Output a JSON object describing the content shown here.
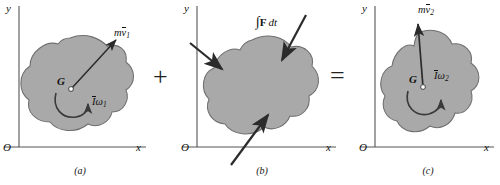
{
  "figure": {
    "background_color": "#ffffff",
    "body_fill_color": "#a9a9a9",
    "body_stroke_color": "#6f6f6f",
    "arrow_color": "#2b2b2b",
    "axis_color": "#555555"
  },
  "operators": {
    "plus": "+",
    "equals": "="
  },
  "panels": [
    {
      "id": "a",
      "caption": "(a)",
      "axes": {
        "y_label": "y",
        "x_label": "x",
        "origin_label": "O"
      },
      "center_label": "G",
      "linear_momentum": {
        "symbol_m": "m",
        "symbol_v": "v",
        "subscript": "1",
        "full": "m v̄1",
        "direction": "up-right"
      },
      "angular_momentum": {
        "symbol_I": "I",
        "symbol_omega": "ω",
        "subscript": "1",
        "full": "Īω1",
        "rotation_sense": "counterclockwise"
      }
    },
    {
      "id": "b",
      "caption": "(b)",
      "axes": {
        "y_label": "y",
        "x_label": "x",
        "origin_label": "O"
      },
      "impulse_label": {
        "integral": "∫",
        "force": "F",
        "differential": "dt",
        "full": "∫F dt"
      },
      "arrows": [
        {
          "name": "impulse-arrow-upper-left",
          "direction": "down-right"
        },
        {
          "name": "impulse-arrow-upper-right",
          "direction": "down-left"
        },
        {
          "name": "impulse-arrow-lower-left",
          "direction": "up-right"
        }
      ]
    },
    {
      "id": "c",
      "caption": "(c)",
      "axes": {
        "y_label": "y",
        "x_label": "x",
        "origin_label": "O"
      },
      "center_label": "G",
      "linear_momentum": {
        "symbol_m": "m",
        "symbol_v": "v",
        "subscript": "2",
        "full": "m v̄2",
        "direction": "up"
      },
      "angular_momentum": {
        "symbol_I": "I",
        "symbol_omega": "ω",
        "subscript": "2",
        "full": "Īω2",
        "rotation_sense": "counterclockwise"
      }
    }
  ]
}
